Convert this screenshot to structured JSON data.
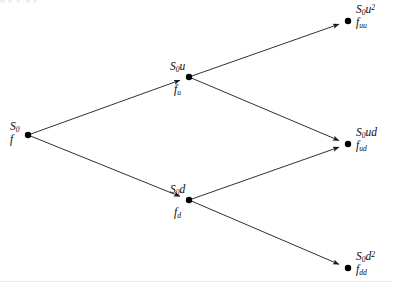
{
  "figure": {
    "background_color": "#ffffff",
    "line_color": "#1a1a1a",
    "node_color": "#000000",
    "text_color": "#0b0b0b",
    "faint_rule_color": "#ececf0",
    "top_clipped_text": "g                                       p            p          g                                  p"
  },
  "diagram": {
    "type": "binomial-tree",
    "steps": 2,
    "nodes": [
      {
        "id": "root",
        "x": 28,
        "y": 135,
        "price": {
          "base": "S",
          "sub": "0",
          "power": ""
        },
        "price_text": "S0",
        "value": {
          "base": "f",
          "sub": ""
        },
        "value_text": "f",
        "label_position": "left-above"
      },
      {
        "id": "up",
        "x": 189,
        "y": 77,
        "price": {
          "base": "S",
          "sub": "0",
          "power": ""
        },
        "price_suffix": "u",
        "price_text": "S0u",
        "value": {
          "base": "f",
          "sub": "u"
        },
        "value_text": "fu",
        "label_position": "above-left"
      },
      {
        "id": "down",
        "x": 189,
        "y": 200,
        "price": {
          "base": "S",
          "sub": "0",
          "power": ""
        },
        "price_suffix": "d",
        "price_text": "S0d",
        "value": {
          "base": "f",
          "sub": "d"
        },
        "value_text": "fd",
        "label_position": "above-left"
      },
      {
        "id": "upup",
        "x": 348,
        "y": 21,
        "price": {
          "base": "S",
          "sub": "0",
          "power": "2"
        },
        "price_suffix": "u",
        "price_text": "S0u2",
        "value": {
          "base": "f",
          "sub": "uu"
        },
        "value_text": "fuu",
        "label_position": "right"
      },
      {
        "id": "updown",
        "x": 348,
        "y": 144,
        "price": {
          "base": "S",
          "sub": "0",
          "power": ""
        },
        "price_suffix": "ud",
        "price_text": "S0ud",
        "value": {
          "base": "f",
          "sub": "ud"
        },
        "value_text": "fud",
        "label_position": "right"
      },
      {
        "id": "downdown",
        "x": 348,
        "y": 268,
        "price": {
          "base": "S",
          "sub": "0",
          "power": "2"
        },
        "price_suffix": "d",
        "price_text": "S0d2",
        "value": {
          "base": "f",
          "sub": "dd"
        },
        "value_text": "fdd",
        "label_position": "right"
      }
    ],
    "edges": [
      {
        "id": "root-up",
        "from": "root",
        "to": "up",
        "x1": 28,
        "y1": 135,
        "x2": 189,
        "y2": 77
      },
      {
        "id": "root-down",
        "from": "root",
        "to": "down",
        "x1": 28,
        "y1": 135,
        "x2": 189,
        "y2": 200
      },
      {
        "id": "up-upup",
        "from": "up",
        "to": "upup",
        "x1": 189,
        "y1": 77,
        "x2": 348,
        "y2": 21
      },
      {
        "id": "up-updown",
        "from": "up",
        "to": "updown",
        "x1": 189,
        "y1": 77,
        "x2": 348,
        "y2": 144
      },
      {
        "id": "down-updown",
        "from": "down",
        "to": "updown",
        "x1": 189,
        "y1": 200,
        "x2": 348,
        "y2": 144
      },
      {
        "id": "down-downdown",
        "from": "down",
        "to": "downdown",
        "x1": 189,
        "y1": 200,
        "x2": 348,
        "y2": 268
      }
    ]
  },
  "labels": {
    "root_price_base": "S",
    "root_price_sub": "0",
    "root_value": "f",
    "up_price_base": "S",
    "up_price_sub": "0",
    "up_price_tail": "u",
    "up_value_base": "f",
    "up_value_sub": "u",
    "down_price_base": "S",
    "down_price_sub": "0",
    "down_price_tail": "d",
    "down_value_base": "f",
    "down_value_sub": "d",
    "upup_price_base": "S",
    "upup_price_sub": "0",
    "upup_price_tail": "u",
    "upup_price_sup": "2",
    "upup_value_base": "f",
    "upup_value_sub": "uu",
    "updown_price_base": "S",
    "updown_price_sub": "0",
    "updown_price_tail": "ud",
    "updown_value_base": "f",
    "updown_value_sub": "ud",
    "downdown_price_base": "S",
    "downdown_price_sub": "0",
    "downdown_price_tail": "d",
    "downdown_price_sup": "2",
    "downdown_value_base": "f",
    "downdown_value_sub": "dd"
  }
}
